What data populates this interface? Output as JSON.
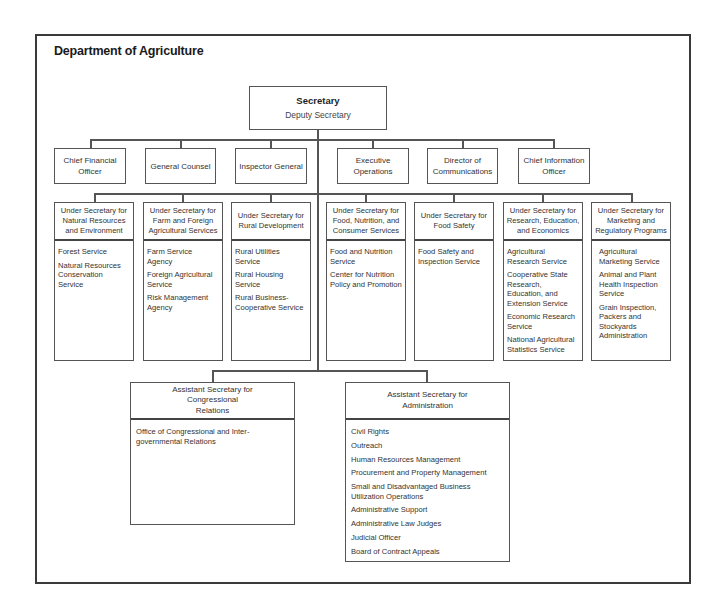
{
  "title": "Department of Agriculture",
  "secretary": {
    "title": "Secretary",
    "subtitle": "Deputy Secretary"
  },
  "staff_offices": [
    {
      "label": "Chief Financial Officer"
    },
    {
      "label": "General Counsel"
    },
    {
      "label": "Inspector General"
    },
    {
      "label": "Executive Operations"
    },
    {
      "label": "Director of Communications"
    },
    {
      "label": "Chief Information Officer"
    }
  ],
  "under_secretaries": [
    {
      "title": "Under Secretary for Natural Resources and Environment",
      "items": [
        "Forest Service",
        "Natural Resources Conservation Service"
      ]
    },
    {
      "title": "Under Secretary for Farm and Foreign Agricultural Services",
      "items": [
        "Farm Service Agency",
        "Foreign Agricultural Service",
        "Risk Management Agency"
      ]
    },
    {
      "title": "Under Secretary for Rural Development",
      "items": [
        "Rural Utilities Service",
        "Rural Housing Service",
        "Rural Business-Cooperative Service"
      ]
    },
    {
      "title": "Under Secretary for Food, Nutrition, and Consumer Services",
      "items": [
        "Food and Nutrition Service",
        "Center for Nutrition Policy and Promotion"
      ]
    },
    {
      "title": "Under Secretary for Food Safety",
      "items": [
        "Food Safety and Inspection Service"
      ]
    },
    {
      "title": "Under Secretary for Research, Education, and Economics",
      "items": [
        "Agricultural Research Service",
        "Cooperative State Research, Education, and Extension Service",
        "Economic Research Service",
        "National Agricultural Statistics Service"
      ]
    },
    {
      "title": "Under Secretary for Marketing and Regulatory Programs",
      "items": [
        "Agricultural Marketing Service",
        "Animal and Plant Health Inspection Service",
        "Grain Inspection, Packers and Stockyards Administration"
      ]
    }
  ],
  "assistant_secretaries": [
    {
      "title": "Assistant Secretary for Congressional Relations",
      "items": [
        "Office of Congressional and Inter-governmental Relations"
      ]
    },
    {
      "title": "Assistant Secretary for Administration",
      "items": [
        "Civil Rights",
        "Outreach",
        "Human Resources Management",
        "Procurement and Property Management",
        "Small and Disadvantaged Business Utilization Operations",
        "Administrative Support",
        "Administrative Law Judges",
        "Judicial Officer",
        "Board of Contract Appeals"
      ]
    }
  ]
}
